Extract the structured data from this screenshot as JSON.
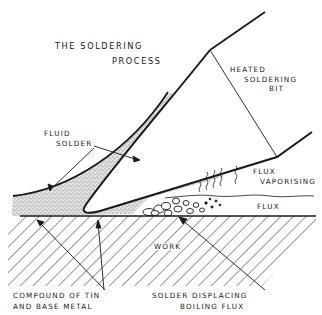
{
  "title": {
    "line1": "THE SOLDERING",
    "line2": "PROCESS"
  },
  "labels": {
    "heated_bit": [
      "HEATED",
      "SOLDERING",
      "BIT"
    ],
    "fluid_solder": [
      "FLUID",
      "SOLDER"
    ],
    "flux_vaporising": [
      "FLUX",
      "VAPORISING"
    ],
    "flux": "FLUX",
    "work": "WORK",
    "compound": [
      "COMPOUND OF TIN",
      "AND BASE METAL"
    ],
    "solder_displacing": [
      "SOLDER DISPLACING",
      "BOILING FLUX"
    ]
  },
  "colors": {
    "ink": "#1a1a1a",
    "stipple": "#9a9a9a",
    "background": "#ffffff"
  }
}
